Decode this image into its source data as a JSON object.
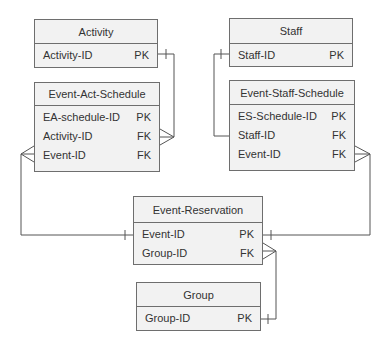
{
  "diagram": {
    "type": "entity-relationship",
    "entities": [
      {
        "id": "activity",
        "name": "Activity",
        "attributes": [
          {
            "name": "Activity-ID",
            "key": "PK"
          }
        ]
      },
      {
        "id": "event-act-schedule",
        "name": "Event-Act-Schedule",
        "attributes": [
          {
            "name": "EA-schedule-ID",
            "key": "PK"
          },
          {
            "name": "Activity-ID",
            "key": "FK"
          },
          {
            "name": "Event-ID",
            "key": "FK"
          }
        ]
      },
      {
        "id": "staff",
        "name": "Staff",
        "attributes": [
          {
            "name": "Staff-ID",
            "key": "PK"
          }
        ]
      },
      {
        "id": "event-staff-schedule",
        "name": "Event-Staff-Schedule",
        "attributes": [
          {
            "name": "ES-Schedule-ID",
            "key": "PK"
          },
          {
            "name": "Staff-ID",
            "key": "FK"
          },
          {
            "name": "Event-ID",
            "key": "FK"
          }
        ]
      },
      {
        "id": "event-reservation",
        "name": "Event-Reservation",
        "attributes": [
          {
            "name": "Event-ID",
            "key": "PK"
          },
          {
            "name": "Group-ID",
            "key": "FK"
          }
        ]
      },
      {
        "id": "group",
        "name": "Group",
        "attributes": [
          {
            "name": "Group-ID",
            "key": "PK"
          }
        ]
      }
    ],
    "relationships": [
      {
        "from": "Activity.Activity-ID",
        "from_card": "one",
        "to": "Event-Act-Schedule.Activity-ID",
        "to_card": "many"
      },
      {
        "from": "Staff.Staff-ID",
        "from_card": "one",
        "to": "Event-Staff-Schedule.Staff-ID",
        "to_card": "none"
      },
      {
        "from": "Event-Reservation.Event-ID",
        "from_card": "one",
        "to": "Event-Act-Schedule.Event-ID",
        "to_card": "many"
      },
      {
        "from": "Event-Reservation.Event-ID",
        "from_card": "one",
        "to": "Event-Staff-Schedule.Event-ID",
        "to_card": "many"
      },
      {
        "from": "Group.Group-ID",
        "from_card": "one",
        "to": "Event-Reservation.Group-ID",
        "to_card": "many"
      }
    ],
    "colors": {
      "entity_fill": "#f2f2f2",
      "border": "#6e6e6e",
      "line": "#555555",
      "text": "#333333"
    }
  }
}
